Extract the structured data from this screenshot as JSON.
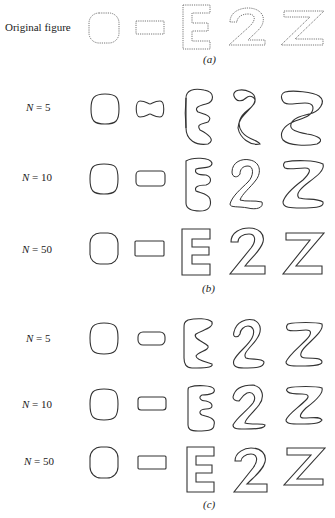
{
  "figure": {
    "panels": [
      {
        "id": "a",
        "caption": "(a)",
        "rows": [
          {
            "label": "Original figure",
            "shapes": [
              "oval",
              "rectangle",
              "E",
              "2",
              "Z"
            ]
          }
        ]
      },
      {
        "id": "b",
        "caption": "(b)",
        "rows": [
          {
            "label": "N = 5",
            "shapes": [
              "oval",
              "rectangle",
              "E",
              "2",
              "Z"
            ]
          },
          {
            "label": "N = 10",
            "shapes": [
              "oval",
              "rectangle",
              "E",
              "2",
              "Z"
            ]
          },
          {
            "label": "N = 50",
            "shapes": [
              "oval",
              "rectangle",
              "E",
              "2",
              "Z"
            ]
          }
        ]
      },
      {
        "id": "c",
        "caption": "(c)",
        "rows": [
          {
            "label": "N = 5",
            "shapes": [
              "oval",
              "rectangle",
              "E",
              "2",
              "Z"
            ]
          },
          {
            "label": "N = 10",
            "shapes": [
              "oval",
              "rectangle",
              "E",
              "2",
              "Z"
            ]
          },
          {
            "label": "N = 50",
            "shapes": [
              "oval",
              "rectangle",
              "E",
              "2",
              "Z"
            ]
          }
        ]
      }
    ]
  },
  "colors": {
    "stroke": "#333333",
    "original_stroke": "#777777",
    "background": "#ffffff"
  }
}
